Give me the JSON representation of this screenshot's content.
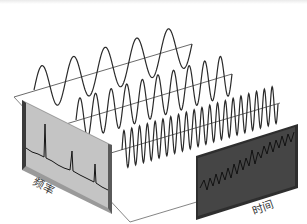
{
  "figure": {
    "labels": {
      "frequency_panel": "频率",
      "time_panel": "时间"
    },
    "waves": [
      {
        "name": "low-frequency-sine",
        "cycles": 5
      },
      {
        "name": "mid-frequency-sine",
        "cycles": 10
      },
      {
        "name": "high-frequency-sine",
        "cycles": 20
      }
    ],
    "spectrum_peaks": 4,
    "colors": {
      "wave_stroke": "#2a2a2a",
      "axis_line": "#444444",
      "frequency_panel_fill": "#b8b8b8",
      "frequency_panel_frame": "#7a7a7a",
      "time_panel_fill": "#3c3c3c",
      "time_panel_trace": "#111111",
      "background": "#ffffff"
    }
  }
}
